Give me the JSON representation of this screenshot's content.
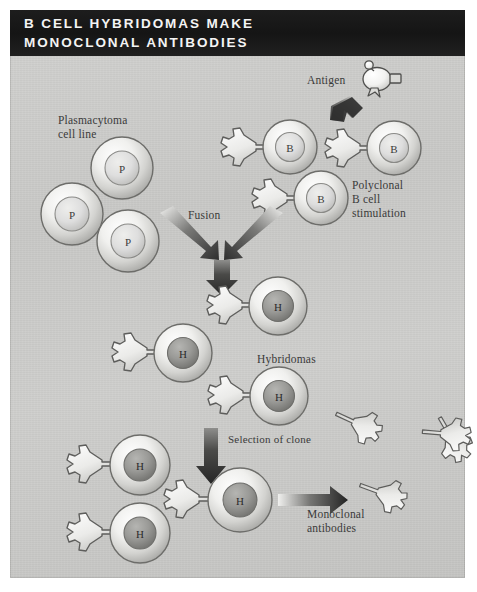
{
  "figure": {
    "title_lines": [
      "B CELL HYBRIDOMAS MAKE",
      "MONOCLONAL ANTIBODIES"
    ],
    "title_full": "B CELL HYBRIDOMAS MAKE MONOCLONAL ANTIBODIES",
    "panel_background": "#cbcbc9",
    "title_background": "#1a1a1a",
    "title_color": "#f4f4f4",
    "label_color": "#3a3a3a",
    "arrow_color": "#3d3d3d"
  },
  "labels": {
    "antigen": "Antigen",
    "plasmacytoma": "Plasmacytoma\ncell line",
    "polyclonal": "Polyclonal\nB cell\nstimulation",
    "fusion": "Fusion",
    "hybridomas": "Hybridomas",
    "selection": "Selection of clone",
    "monoclonal": "Monoclonal\nantibodies"
  },
  "cells": {
    "plasmacytoma": [
      {
        "label": "P",
        "cx": 122,
        "cy": 168,
        "r": 31
      },
      {
        "label": "P",
        "cx": 72,
        "cy": 214,
        "r": 31
      },
      {
        "label": "P",
        "cx": 128,
        "cy": 241,
        "r": 31
      }
    ],
    "b_cells": [
      {
        "label": "B",
        "cx": 290,
        "cy": 147,
        "r": 27
      },
      {
        "label": "B",
        "cx": 394,
        "cy": 148,
        "r": 27
      },
      {
        "label": "B",
        "cx": 321,
        "cy": 198,
        "r": 27
      }
    ],
    "hybridomas_mid": [
      {
        "label": "H",
        "cx": 278,
        "cy": 306,
        "r": 29
      },
      {
        "label": "H",
        "cx": 183,
        "cy": 353,
        "r": 29
      },
      {
        "label": "H",
        "cx": 279,
        "cy": 396,
        "r": 29
      }
    ],
    "hybridomas_bottom": [
      {
        "label": "H",
        "cx": 140,
        "cy": 465,
        "r": 30
      },
      {
        "label": "H",
        "cx": 140,
        "cy": 533,
        "r": 30
      },
      {
        "label": "H",
        "cx": 240,
        "cy": 500,
        "r": 32
      }
    ]
  },
  "free_antibodies": [
    {
      "x": 373,
      "y": 465,
      "rot": -25
    },
    {
      "x": 421,
      "y": 482,
      "rot": 35
    },
    {
      "x": 404,
      "y": 526,
      "rot": 10
    },
    {
      "x": 452,
      "y": 455,
      "rot": -60
    }
  ],
  "antigen": {
    "cx": 377,
    "cy": 78
  },
  "arrows": {
    "antigen_arrow": "down-left arrow from antigen to B cells",
    "fusion_left": "down-right arrow from plasmacytoma to fusion point",
    "fusion_right": "down-left arrow from B cells to fusion point",
    "fusion_down": "short down arrow below fusion",
    "selection_down": "down arrow to selected clone",
    "secretion_right": "right arrow from clone to free antibodies"
  },
  "icon_names": {
    "cell": "cell-icon",
    "antibody": "antibody-y-icon",
    "antigen": "antigen-icon",
    "arrow": "arrow-icon"
  }
}
